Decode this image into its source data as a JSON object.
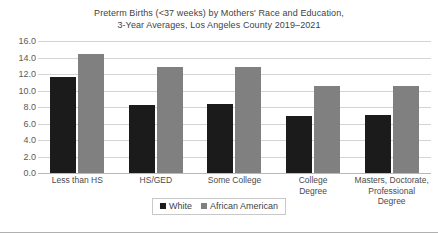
{
  "chart_data": {
    "type": "bar",
    "title": "Preterm Births (<37 weeks) by Mothers' Race and Education, 3-Year Averages, Los Angeles County 2019–2021",
    "title_lines": [
      "Preterm Births (<37 weeks) by Mothers' Race and Education,",
      "3-Year Averages, Los Angeles County 2019–2021"
    ],
    "xlabel": "",
    "ylabel": "",
    "ylim": [
      0.0,
      16.0
    ],
    "ytick_step": 2.0,
    "ytick_labels": [
      "16.0",
      "14.0",
      "12.0",
      "10.0",
      "8.0",
      "6.0",
      "4.0",
      "2.0",
      "0.0"
    ],
    "ytick_values": [
      16.0,
      14.0,
      12.0,
      10.0,
      8.0,
      6.0,
      4.0,
      2.0,
      0.0
    ],
    "grid": true,
    "legend_position": "bottom",
    "categories": [
      "Less than HS",
      "HS/GED",
      "Some College",
      "College Degree",
      "Masters, Doctorate, Professional Degree"
    ],
    "category_label_lines": [
      [
        "Less than HS"
      ],
      [
        "HS/GED"
      ],
      [
        "Some College"
      ],
      [
        "College",
        "Degree"
      ],
      [
        "Masters, Doctorate,",
        "Professional Degree"
      ]
    ],
    "series": [
      {
        "name": "White",
        "color": "#1b1b1b",
        "values": [
          11.6,
          8.3,
          8.4,
          6.9,
          7.0
        ]
      },
      {
        "name": "African American",
        "color": "#808080",
        "values": [
          14.4,
          12.8,
          12.9,
          10.5,
          10.5
        ]
      }
    ]
  }
}
